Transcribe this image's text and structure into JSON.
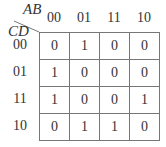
{
  "kmap": {
    "row_variable": "CD",
    "col_variable": "AB",
    "col_headers": [
      "00",
      "01",
      "11",
      "10"
    ],
    "row_headers": [
      "00",
      "01",
      "11",
      "10"
    ],
    "cells": [
      [
        "0",
        "1",
        "0",
        "0"
      ],
      [
        "1",
        "0",
        "0",
        "0"
      ],
      [
        "1",
        "0",
        "0",
        "1"
      ],
      [
        "0",
        "1",
        "1",
        "0"
      ]
    ],
    "line_color": "#777777",
    "text_color": "#333333"
  }
}
